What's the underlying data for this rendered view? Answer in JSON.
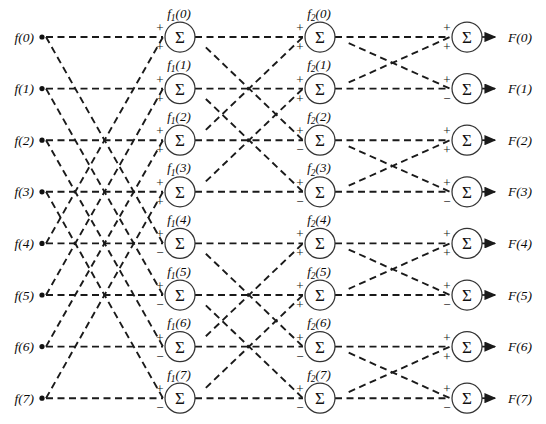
{
  "figure": {
    "type": "butterfly-signal-flow-graph",
    "stage_count": 3,
    "line_count": 8,
    "sum_glyph": "Σ",
    "colors": {
      "line": "#1a1a1a",
      "node_stroke": "#333333",
      "node_fill": "#ffffff",
      "text": "#0a0a0a",
      "background": "#ffffff"
    }
  },
  "inputs": [
    {
      "label": "f(0)",
      "index": 0
    },
    {
      "label": "f(1)",
      "index": 1
    },
    {
      "label": "f(2)",
      "index": 2
    },
    {
      "label": "f(3)",
      "index": 3
    },
    {
      "label": "f(4)",
      "index": 4
    },
    {
      "label": "f(5)",
      "index": 5
    },
    {
      "label": "f(6)",
      "index": 6
    },
    {
      "label": "f(7)",
      "index": 7
    }
  ],
  "outputs": [
    {
      "label": "F(0)",
      "index": 0
    },
    {
      "label": "F(1)",
      "index": 1
    },
    {
      "label": "F(2)",
      "index": 2
    },
    {
      "label": "F(3)",
      "index": 3
    },
    {
      "label": "F(4)",
      "index": 4
    },
    {
      "label": "F(5)",
      "index": 5
    },
    {
      "label": "F(6)",
      "index": 6
    },
    {
      "label": "F(7)",
      "index": 7
    }
  ],
  "stages": [
    {
      "name": "stage-1",
      "stage_index": 1,
      "label_base": "f",
      "label_subscript": "1",
      "pair_span": 4,
      "nodes": [
        {
          "index": 0,
          "label_text": "f",
          "subscript": "1",
          "arg": "(0)",
          "sign_top": "+",
          "sign_bottom": "+"
        },
        {
          "index": 1,
          "label_text": "f",
          "subscript": "1",
          "arg": "(1)",
          "sign_top": "+",
          "sign_bottom": "+"
        },
        {
          "index": 2,
          "label_text": "f",
          "subscript": "1",
          "arg": "(2)",
          "sign_top": "+",
          "sign_bottom": "+"
        },
        {
          "index": 3,
          "label_text": "f",
          "subscript": "1",
          "arg": "(3)",
          "sign_top": "+",
          "sign_bottom": "+"
        },
        {
          "index": 4,
          "label_text": "f",
          "subscript": "1",
          "arg": "(4)",
          "sign_top": "+",
          "sign_bottom": "−"
        },
        {
          "index": 5,
          "label_text": "f",
          "subscript": "1",
          "arg": "(5)",
          "sign_top": "+",
          "sign_bottom": "−"
        },
        {
          "index": 6,
          "label_text": "f",
          "subscript": "1",
          "arg": "(6)",
          "sign_top": "+",
          "sign_bottom": "−"
        },
        {
          "index": 7,
          "label_text": "f",
          "subscript": "1",
          "arg": "(7)",
          "sign_top": "+",
          "sign_bottom": "−"
        }
      ]
    },
    {
      "name": "stage-2",
      "stage_index": 2,
      "label_base": "f",
      "label_subscript": "2",
      "pair_span": 2,
      "nodes": [
        {
          "index": 0,
          "label_text": "f",
          "subscript": "2",
          "arg": "(0)",
          "sign_top": "+",
          "sign_bottom": "+"
        },
        {
          "index": 1,
          "label_text": "f",
          "subscript": "2",
          "arg": "(1)",
          "sign_top": "+",
          "sign_bottom": "+"
        },
        {
          "index": 2,
          "label_text": "f",
          "subscript": "2",
          "arg": "(2)",
          "sign_top": "+",
          "sign_bottom": "−"
        },
        {
          "index": 3,
          "label_text": "f",
          "subscript": "2",
          "arg": "(3)",
          "sign_top": "+",
          "sign_bottom": "−"
        },
        {
          "index": 4,
          "label_text": "f",
          "subscript": "2",
          "arg": "(4)",
          "sign_top": "+",
          "sign_bottom": "+"
        },
        {
          "index": 5,
          "label_text": "f",
          "subscript": "2",
          "arg": "(5)",
          "sign_top": "+",
          "sign_bottom": "+"
        },
        {
          "index": 6,
          "label_text": "f",
          "subscript": "2",
          "arg": "(6)",
          "sign_top": "+",
          "sign_bottom": "−"
        },
        {
          "index": 7,
          "label_text": "f",
          "subscript": "2",
          "arg": "(7)",
          "sign_top": "+",
          "sign_bottom": "−"
        }
      ]
    },
    {
      "name": "stage-3",
      "stage_index": 3,
      "label_base": "F",
      "label_subscript": "",
      "pair_span": 1,
      "nodes": [
        {
          "index": 0,
          "label_text": "",
          "subscript": "",
          "arg": "",
          "sign_top": "+",
          "sign_bottom": "+"
        },
        {
          "index": 1,
          "label_text": "",
          "subscript": "",
          "arg": "",
          "sign_top": "+",
          "sign_bottom": "−"
        },
        {
          "index": 2,
          "label_text": "",
          "subscript": "",
          "arg": "",
          "sign_top": "+",
          "sign_bottom": "+"
        },
        {
          "index": 3,
          "label_text": "",
          "subscript": "",
          "arg": "",
          "sign_top": "+",
          "sign_bottom": "−"
        },
        {
          "index": 4,
          "label_text": "",
          "subscript": "",
          "arg": "",
          "sign_top": "+",
          "sign_bottom": "+"
        },
        {
          "index": 5,
          "label_text": "",
          "subscript": "",
          "arg": "",
          "sign_top": "+",
          "sign_bottom": "−"
        },
        {
          "index": 6,
          "label_text": "",
          "subscript": "",
          "arg": "",
          "sign_top": "+",
          "sign_bottom": "+"
        },
        {
          "index": 7,
          "label_text": "",
          "subscript": "",
          "arg": "",
          "sign_top": "+",
          "sign_bottom": "−"
        }
      ]
    }
  ],
  "geometry": {
    "width": 546,
    "height": 424,
    "row_y_start": 37,
    "row_spacing": 51.6,
    "col_input_x": 42,
    "col_stage_x": [
      180,
      320,
      467
    ],
    "node_radius": 15,
    "output_label_x": 508,
    "output_arrow_end": 495
  }
}
